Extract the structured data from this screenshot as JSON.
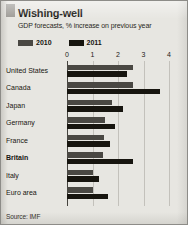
{
  "title": "Wishing-well",
  "subtitle": "GDP forecasts, % increase on previous year",
  "source": "Source: IMF",
  "legend": [
    {
      "label": "2010",
      "color": "#4a4843",
      "key": "2010"
    },
    {
      "label": "2011",
      "color": "#17150f",
      "key": "2011"
    }
  ],
  "colors": {
    "series_2010": "#4a4843",
    "series_2011": "#17150f",
    "background": "#e7e6e1",
    "gridline": "#c3c1bb",
    "axis": "#45433e",
    "text": "#17150f"
  },
  "chart_data": {
    "type": "bar",
    "orientation": "horizontal",
    "title": "Wishing-well",
    "subtitle": "GDP forecasts, % increase on previous year",
    "xlabel": "",
    "ylabel": "",
    "xlim": [
      0,
      4
    ],
    "xticks": [
      0,
      1,
      2,
      3,
      4
    ],
    "xtick_labels": [
      "0",
      "1",
      "2",
      "3",
      "4"
    ],
    "grid": true,
    "legend_position": "top-left",
    "source": "Source: IMF",
    "highlight_category": "Britain",
    "categories": [
      "United States",
      "Canada",
      "Japan",
      "Germany",
      "France",
      "Britain",
      "Italy",
      "Euro area"
    ],
    "series": [
      {
        "name": "2010",
        "color": "#4a4843",
        "values": [
          2.6,
          2.6,
          1.75,
          1.5,
          1.45,
          1.4,
          1.0,
          1.0
        ]
      },
      {
        "name": "2011",
        "color": "#17150f",
        "values": [
          2.35,
          3.65,
          2.2,
          1.9,
          1.7,
          2.6,
          1.25,
          1.6
        ]
      }
    ]
  }
}
